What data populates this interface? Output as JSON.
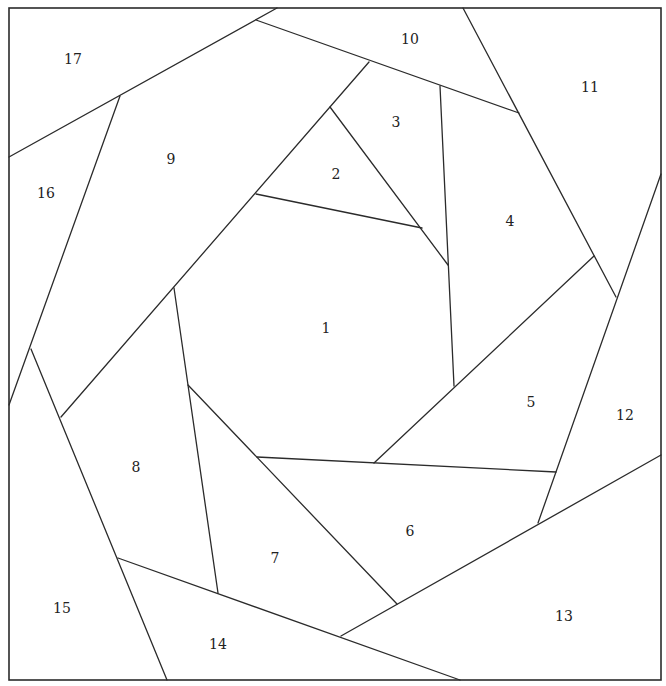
{
  "diagram": {
    "type": "paper-piecing pattern (crazy spiral block)",
    "stroke_color": "#2b2b2b",
    "background": "#ffffff",
    "border": {
      "x": 9,
      "y": 8,
      "width": 652,
      "height": 672
    },
    "lines": [
      [
        9,
        157,
        277,
        8
      ],
      [
        256,
        20,
        519,
        113
      ],
      [
        463,
        8,
        616,
        297
      ],
      [
        661,
        174,
        538,
        523
      ],
      [
        661,
        455,
        341,
        636
      ],
      [
        118,
        558,
        460,
        680
      ],
      [
        31,
        349,
        167,
        680
      ],
      [
        9,
        405,
        120,
        96
      ],
      [
        369,
        62,
        61,
        417
      ],
      [
        330,
        107,
        448,
        265
      ],
      [
        256,
        194,
        422,
        228
      ],
      [
        440,
        86,
        454,
        386
      ],
      [
        594,
        256,
        374,
        463
      ],
      [
        257,
        457,
        556,
        472
      ],
      [
        188,
        385,
        397,
        604
      ],
      [
        174,
        288,
        218,
        593
      ]
    ],
    "pieces": [
      {
        "label": "1",
        "x": 326,
        "y": 329
      },
      {
        "label": "2",
        "x": 336,
        "y": 175
      },
      {
        "label": "3",
        "x": 396,
        "y": 123
      },
      {
        "label": "4",
        "x": 510,
        "y": 222
      },
      {
        "label": "5",
        "x": 531,
        "y": 403
      },
      {
        "label": "6",
        "x": 410,
        "y": 532
      },
      {
        "label": "7",
        "x": 275,
        "y": 559
      },
      {
        "label": "8",
        "x": 136,
        "y": 468
      },
      {
        "label": "9",
        "x": 171,
        "y": 160
      },
      {
        "label": "10",
        "x": 410,
        "y": 40
      },
      {
        "label": "11",
        "x": 590,
        "y": 88
      },
      {
        "label": "12",
        "x": 625,
        "y": 416
      },
      {
        "label": "13",
        "x": 564,
        "y": 617
      },
      {
        "label": "14",
        "x": 218,
        "y": 645
      },
      {
        "label": "15",
        "x": 62,
        "y": 609
      },
      {
        "label": "16",
        "x": 46,
        "y": 194
      },
      {
        "label": "17",
        "x": 73,
        "y": 60
      }
    ]
  }
}
